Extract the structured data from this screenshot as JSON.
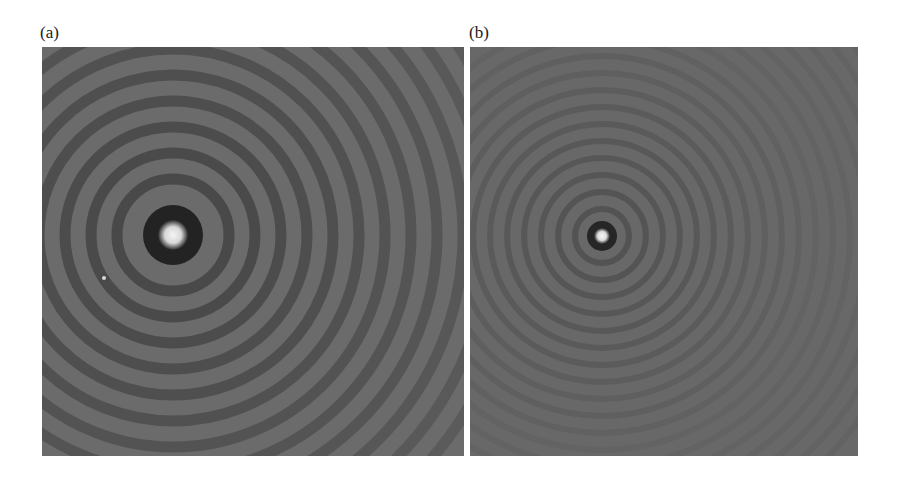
{
  "figure": {
    "panels": [
      {
        "label": "(a)",
        "description": "Concentric ring diffraction pattern with bright central spot and widely spaced rings",
        "center": [
          131,
          188
        ],
        "core_radius": 13,
        "dark_ring_radius": 30,
        "ring_spacing": 26,
        "ring_count": 12,
        "background": "#6b6b6b",
        "speck": [
          62,
          231
        ]
      },
      {
        "label": "(b)",
        "description": "Concentric ring diffraction pattern with small bright central spot and finely spaced faint rings",
        "center": [
          132,
          189
        ],
        "core_radius": 7,
        "dark_ring_radius": 15,
        "ring_spacing": 17,
        "ring_count": 18,
        "background": "#686868"
      }
    ]
  }
}
